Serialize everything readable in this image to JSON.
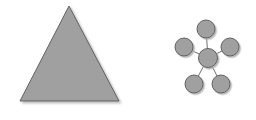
{
  "canvas": {
    "width": 256,
    "height": 120,
    "background_color": "#ffffff",
    "title": "Two gray geometric figures: a filled triangle and a star-topology node graph"
  },
  "style": {
    "shape_fill_color": "#a0a0a0",
    "shape_stroke_color": "#606060",
    "shape_stroke_width": 1,
    "edge_color": "#707070",
    "edge_width": 1,
    "shadow_color": "#c8c8c8",
    "shadow_offset_x": 2,
    "shadow_offset_y": 2
  },
  "figures": [
    {
      "name": "triangle",
      "label": "Triangle",
      "type": "polygon",
      "sides": 3,
      "points": [
        {
          "x": 69,
          "y": 6
        },
        {
          "x": 20,
          "y": 101
        },
        {
          "x": 119,
          "y": 101
        }
      ],
      "points_str": "69,6 20,101 119,101",
      "fill": "#a0a0a0",
      "stroke": "#606060",
      "centroid": {
        "x": 69.3,
        "y": 69.3
      },
      "base_width": 99,
      "height": 95
    },
    {
      "name": "node-graph",
      "label": "Star Node Graph",
      "type": "graph",
      "topology": "star",
      "node_count": 6,
      "edge_count": 5,
      "node_radius": 9,
      "center_node_radius": 9.5,
      "nodes": [
        {
          "id": "center",
          "label": "hub",
          "cx": 208,
          "cy": 58,
          "r": 9.5
        },
        {
          "id": "top",
          "label": "node-top",
          "cx": 206,
          "cy": 29,
          "r": 9
        },
        {
          "id": "left",
          "label": "node-left",
          "cx": 184,
          "cy": 47,
          "r": 9
        },
        {
          "id": "right",
          "label": "node-right",
          "cx": 230,
          "cy": 47,
          "r": 9
        },
        {
          "id": "bottom-left",
          "label": "node-bottom-left",
          "cx": 194,
          "cy": 84,
          "r": 9
        },
        {
          "id": "bottom-right",
          "label": "node-bottom-right",
          "cx": 221,
          "cy": 84,
          "r": 9
        }
      ],
      "edges": [
        {
          "from": "center",
          "to": "top",
          "x1": 208,
          "y1": 58,
          "x2": 206,
          "y2": 29
        },
        {
          "from": "center",
          "to": "left",
          "x1": 208,
          "y1": 58,
          "x2": 184,
          "y2": 47
        },
        {
          "from": "center",
          "to": "right",
          "x1": 208,
          "y1": 58,
          "x2": 230,
          "y2": 47
        },
        {
          "from": "center",
          "to": "bottom-left",
          "x1": 208,
          "y1": 58,
          "x2": 194,
          "y2": 84
        },
        {
          "from": "center",
          "to": "bottom-right",
          "x1": 208,
          "y1": 58,
          "x2": 221,
          "y2": 84
        }
      ]
    }
  ]
}
